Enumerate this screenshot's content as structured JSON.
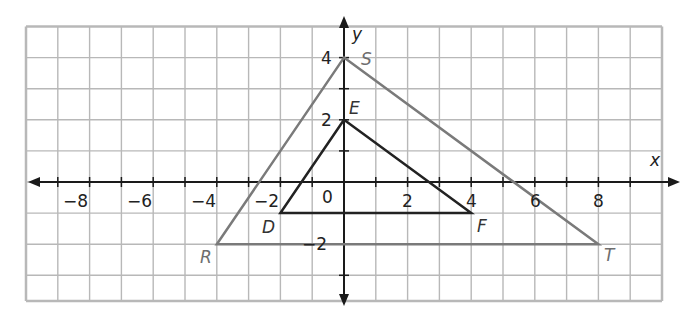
{
  "chart_data": {
    "type": "diagram",
    "title": "",
    "axes": {
      "x_label": "x",
      "y_label": "y",
      "x_range": [
        -10,
        10
      ],
      "y_range": [
        -3.9,
        5
      ],
      "x_tick_labels": [
        "−8",
        "−6",
        "−4",
        "−2",
        "2",
        "4",
        "6",
        "8"
      ],
      "x_tick_values": [
        -8,
        -6,
        -4,
        -2,
        2,
        4,
        6,
        8
      ],
      "y_tick_labels": [
        "4",
        "2",
        "−2"
      ],
      "y_tick_values": [
        4,
        2,
        -2
      ],
      "origin_label": "0",
      "grid": true,
      "grid_step": 1
    },
    "triangles": [
      {
        "name": "RST",
        "color": "#7a7a7a",
        "vertices": [
          {
            "label": "S",
            "x": 0,
            "y": 4
          },
          {
            "label": "R",
            "x": -4,
            "y": -2
          },
          {
            "label": "T",
            "x": 8,
            "y": -2
          }
        ]
      },
      {
        "name": "DEF",
        "color": "#222222",
        "vertices": [
          {
            "label": "E",
            "x": 0,
            "y": 2
          },
          {
            "label": "D",
            "x": -2,
            "y": -1
          },
          {
            "label": "F",
            "x": 4,
            "y": -1
          }
        ]
      }
    ]
  },
  "labels": {
    "x_axis": "x",
    "y_axis": "y",
    "origin": "0",
    "x_ticks": [
      "−8",
      "−6",
      "−4",
      "−2",
      "2",
      "4",
      "6",
      "8"
    ],
    "y_ticks": [
      "4",
      "2",
      "−2"
    ],
    "S": "S",
    "R": "R",
    "T": "T",
    "E": "E",
    "D": "D",
    "F": "F"
  },
  "colors": {
    "grid": "#b8b8b8",
    "axis": "#1a1a1a",
    "outer_triangle": "#7a7a7a",
    "inner_triangle": "#222222",
    "outer_label": "#6e6e6e",
    "inner_label": "#333333"
  }
}
